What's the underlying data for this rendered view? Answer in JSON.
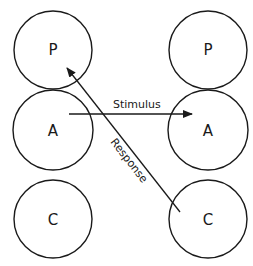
{
  "diagram": {
    "nodes": {
      "left_p": {
        "label": "P",
        "cx": 53,
        "cy": 50,
        "r": 39
      },
      "left_a": {
        "label": "A",
        "cx": 53,
        "cy": 130,
        "r": 40
      },
      "left_c": {
        "label": "C",
        "cx": 53,
        "cy": 219,
        "r": 39
      },
      "right_p": {
        "label": "P",
        "cx": 208,
        "cy": 50,
        "r": 39
      },
      "right_a": {
        "label": "A",
        "cx": 208,
        "cy": 130,
        "r": 40
      },
      "right_c": {
        "label": "C",
        "cx": 208,
        "cy": 219,
        "r": 39
      }
    },
    "edges": {
      "stimulus": {
        "label": "Stimulus",
        "from": "left_a",
        "to": "right_a"
      },
      "response": {
        "label": "Response",
        "from": "right_c",
        "to": "left_p"
      }
    }
  }
}
